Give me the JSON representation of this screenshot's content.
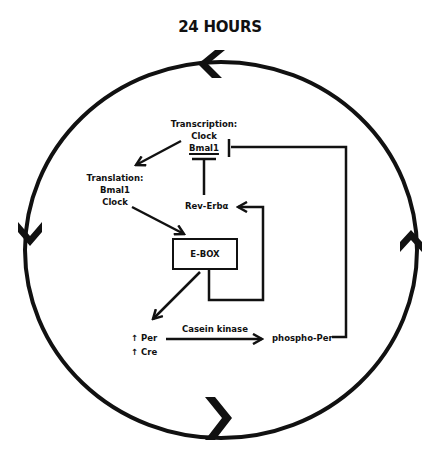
{
  "title": "24 HOURS",
  "nodes": {
    "transcription": {
      "heading": "Transcription:",
      "line1": "Clock",
      "line2": "Bmal1"
    },
    "translation": {
      "heading": "Translation:",
      "line1": "Bmal1",
      "line2": "Clock"
    },
    "rev_erb": {
      "label": "Rev-Erbα"
    },
    "ebox": {
      "label": "E-BOX"
    },
    "per": {
      "label": "↑ Per"
    },
    "cre": {
      "label": "↑ Cre"
    },
    "phospho_per": {
      "label": "phospho-Per"
    }
  },
  "edges": {
    "casein_kinase": {
      "label": "Casein kinase"
    }
  },
  "cycle_arrows": {
    "top": "chevron-left",
    "left": "chevron-down",
    "bottom": "chevron-right",
    "right": "chevron-up"
  },
  "colors": {
    "line": "#111111",
    "background": "#ffffff"
  }
}
